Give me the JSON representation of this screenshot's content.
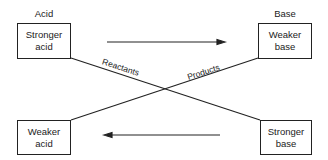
{
  "headings": {
    "left": "Acid",
    "right": "Base"
  },
  "boxes": {
    "top_left": {
      "line1": "Stronger",
      "line2": "acid"
    },
    "top_right": {
      "line1": "Weaker",
      "line2": "base"
    },
    "bottom_left": {
      "line1": "Weaker",
      "line2": "acid"
    },
    "bottom_right": {
      "line1": "Stronger",
      "line2": "base"
    }
  },
  "diagonal_labels": {
    "reactants": "Reactants",
    "products": "Products"
  },
  "arrows": {
    "top": "right",
    "bottom": "left"
  },
  "colors": {
    "line": "#222222",
    "background": "#ffffff"
  }
}
